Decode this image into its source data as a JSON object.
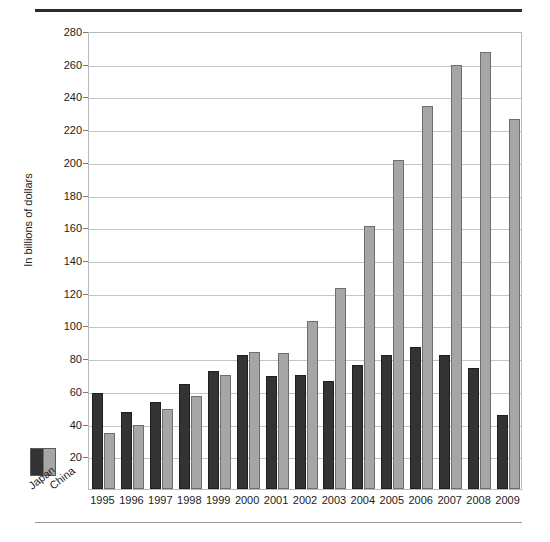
{
  "chart_data": {
    "type": "bar",
    "title": "",
    "subtitle": "",
    "xlabel": "",
    "ylabel": "In billions of dollars",
    "ylim": [
      0,
      280
    ],
    "ytick_step": 20,
    "yticks": [
      "280",
      "260",
      "240",
      "220",
      "200",
      "180",
      "160",
      "140",
      "120",
      "100",
      "80",
      "60",
      "40",
      "20"
    ],
    "grid": true,
    "legend_position": "bottom-left-outside",
    "categories": [
      "1995",
      "1996",
      "1997",
      "1998",
      "1999",
      "2000",
      "2001",
      "2002",
      "2003",
      "2004",
      "2005",
      "2006",
      "2007",
      "2008",
      "2009"
    ],
    "series": [
      {
        "name": "Japan",
        "color": "#333333",
        "values": [
          59,
          47,
          53,
          64,
          72,
          82,
          69,
          70,
          66,
          76,
          82,
          87,
          82,
          74,
          45
        ]
      },
      {
        "name": "China",
        "color": "#a6a6a6",
        "values": [
          34,
          39,
          49,
          57,
          70,
          84,
          83,
          103,
          123,
          161,
          201,
          234,
          259,
          267,
          226
        ]
      }
    ]
  },
  "legend": {
    "japan_label": "Japan",
    "china_label": "China"
  },
  "colors": {
    "japan": "#333333",
    "china": "#a6a6a6",
    "grid": "#c4c4c4",
    "frame": "#b9b9b9",
    "rule_top": "#2b2b2b",
    "rule_bottom": "#9a9a9a"
  }
}
